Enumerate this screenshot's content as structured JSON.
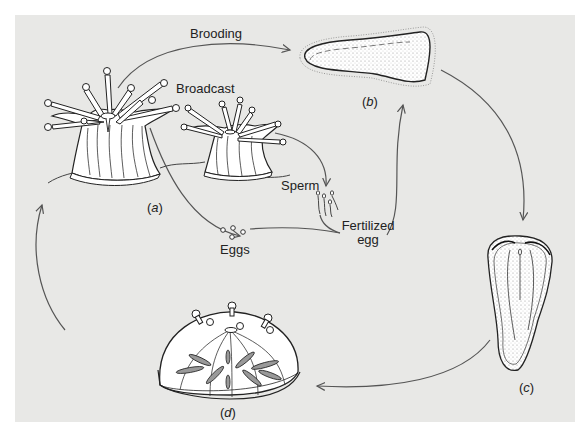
{
  "diagram": {
    "type": "life-cycle",
    "colors": {
      "panel_background": "#e8e8e6",
      "line": "#555555",
      "ink": "#222222",
      "body_fill": "#ffffff"
    },
    "labels": {
      "brooding": "Brooding",
      "broadcast": "Broadcast",
      "sperm": "Sperm",
      "eggs": "Eggs",
      "fertilized_egg_line1": "Fertilized",
      "fertilized_egg_line2": "egg"
    },
    "stages": [
      {
        "id": "a",
        "label_open": "(",
        "letter": "a",
        "label_close": ")",
        "description": "adult polyps"
      },
      {
        "id": "b",
        "label_open": "(",
        "letter": "b",
        "label_close": ")",
        "description": "planula larva"
      },
      {
        "id": "c",
        "label_open": "(",
        "letter": "c",
        "label_close": ")",
        "description": "settling larva"
      },
      {
        "id": "d",
        "label_open": "(",
        "letter": "d",
        "label_close": ")",
        "description": "juvenile polyp"
      }
    ],
    "arrows": [
      {
        "from": "a",
        "to": "b",
        "label": "Brooding"
      },
      {
        "from": "a",
        "to": "eggs",
        "label": ""
      },
      {
        "from": "broadcast polyp",
        "to": "sperm",
        "label": ""
      },
      {
        "from": "eggs",
        "to": "fertilized egg",
        "label": ""
      },
      {
        "from": "fertilized egg",
        "to": "b",
        "label": ""
      },
      {
        "from": "b",
        "to": "c",
        "label": ""
      },
      {
        "from": "c",
        "to": "d",
        "label": ""
      },
      {
        "from": "d",
        "to": "a",
        "label": ""
      }
    ]
  }
}
